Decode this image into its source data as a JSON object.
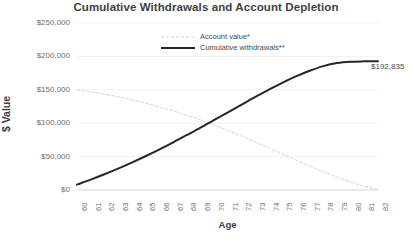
{
  "chart_data": {
    "type": "line",
    "title": "Cumulative Withdrawals and Account Depletion",
    "xlabel": "Age",
    "ylabel": "$ Value",
    "x": [
      60,
      61,
      62,
      63,
      64,
      65,
      66,
      67,
      68,
      69,
      70,
      71,
      72,
      73,
      74,
      75,
      76,
      77,
      78,
      79,
      80,
      81,
      82
    ],
    "categories": [
      "60",
      "61",
      "62",
      "63",
      "64",
      "65",
      "66",
      "67",
      "68",
      "69",
      "70",
      "71",
      "72",
      "73",
      "74",
      "75",
      "76",
      "77",
      "78",
      "79",
      "80",
      "81",
      "82"
    ],
    "xlim": [
      60,
      82
    ],
    "ylim": [
      0,
      250000
    ],
    "yticks": [
      0,
      50000,
      100000,
      150000,
      200000,
      250000
    ],
    "ytick_labels": [
      "$0",
      "$50,000",
      "$100,000",
      "$150,000",
      "$200,000",
      "$250,000"
    ],
    "grid": true,
    "legend_position": "top-center",
    "series": [
      {
        "name": "Account value*",
        "style": "dashed",
        "color": "#d4d4d4",
        "values": [
          150000,
          147000,
          143500,
          139500,
          135000,
          130000,
          124500,
          118500,
          112000,
          105000,
          97500,
          89500,
          81000,
          72000,
          63000,
          54000,
          45000,
          36000,
          27500,
          19500,
          12000,
          5500,
          1000
        ]
      },
      {
        "name": "Cumulative withdrawals**",
        "style": "solid",
        "color": "#262626",
        "values": [
          8000,
          15500,
          23500,
          32000,
          41000,
          50500,
          60500,
          71000,
          82000,
          93000,
          104500,
          116000,
          127500,
          139000,
          150000,
          160500,
          170000,
          178500,
          185500,
          190000,
          192000,
          192600,
          192835
        ]
      }
    ],
    "annotations": [
      {
        "name": "end-value-label",
        "text": "$192,835",
        "x": 82,
        "y": 192835,
        "series": "Cumulative withdrawals**"
      }
    ]
  }
}
